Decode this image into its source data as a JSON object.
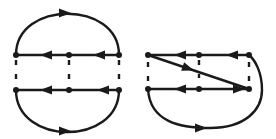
{
  "diagram": {
    "type": "directed-graph-pair",
    "stroke_color": "#1a1a1a",
    "background": "#ffffff",
    "left": {
      "nodes": [
        {
          "id": "L1",
          "x": 16,
          "y": 55
        },
        {
          "id": "L2",
          "x": 69,
          "y": 55
        },
        {
          "id": "L3",
          "x": 119,
          "y": 55
        },
        {
          "id": "L4",
          "x": 16,
          "y": 90
        },
        {
          "id": "L5",
          "x": 69,
          "y": 90
        },
        {
          "id": "L6",
          "x": 119,
          "y": 90
        }
      ],
      "edges": [
        {
          "from": "L3",
          "to": "L2",
          "style": "solid"
        },
        {
          "from": "L2",
          "to": "L1",
          "style": "solid"
        },
        {
          "from": "L6",
          "to": "L5",
          "style": "solid"
        },
        {
          "from": "L5",
          "to": "L4",
          "style": "solid"
        },
        {
          "from": "L1",
          "to": "L3",
          "style": "arc-top"
        },
        {
          "from": "L4",
          "to": "L6",
          "style": "arc-bottom"
        },
        {
          "from": "L1",
          "to": "L4",
          "style": "dashed"
        },
        {
          "from": "L2",
          "to": "L5",
          "style": "dashed"
        },
        {
          "from": "L3",
          "to": "L6",
          "style": "dashed"
        }
      ]
    },
    "right": {
      "nodes": [
        {
          "id": "R1",
          "x": 148,
          "y": 55
        },
        {
          "id": "R2",
          "x": 199,
          "y": 55
        },
        {
          "id": "R3",
          "x": 249,
          "y": 55
        },
        {
          "id": "R4",
          "x": 148,
          "y": 89
        },
        {
          "id": "R5",
          "x": 199,
          "y": 89
        },
        {
          "id": "R6",
          "x": 249,
          "y": 89
        }
      ],
      "edges": [
        {
          "from": "R3",
          "to": "R2",
          "style": "solid"
        },
        {
          "from": "R2",
          "to": "R1",
          "style": "solid"
        },
        {
          "from": "R6",
          "to": "R5",
          "style": "solid"
        },
        {
          "from": "R5",
          "to": "R4",
          "style": "solid"
        },
        {
          "from": "R1",
          "to": "R6",
          "style": "diagonal"
        },
        {
          "from": "R4",
          "to": "R3",
          "style": "arc-outer"
        },
        {
          "from": "R1",
          "to": "R4",
          "style": "dashed"
        },
        {
          "from": "R2",
          "to": "R5",
          "style": "dashed"
        },
        {
          "from": "R3",
          "to": "R6",
          "style": "dashed"
        }
      ]
    }
  }
}
